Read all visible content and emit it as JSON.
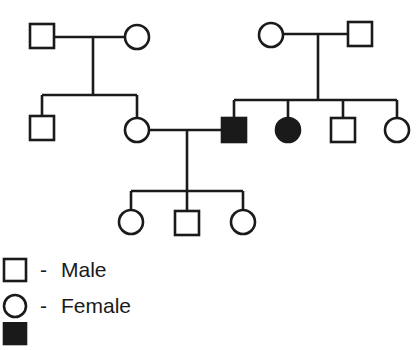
{
  "diagram": {
    "type": "pedigree",
    "line_color": "#1a1a1a",
    "fill_affected": "#1a1a1a",
    "individuals": [
      {
        "id": "I-1",
        "sex": "male",
        "affected": false,
        "generation": 1
      },
      {
        "id": "I-2",
        "sex": "female",
        "affected": false,
        "generation": 1
      },
      {
        "id": "I-3",
        "sex": "female",
        "affected": false,
        "generation": 1
      },
      {
        "id": "I-4",
        "sex": "male",
        "affected": false,
        "generation": 1
      },
      {
        "id": "II-1",
        "sex": "male",
        "affected": false,
        "generation": 2
      },
      {
        "id": "II-2",
        "sex": "female",
        "affected": false,
        "generation": 2
      },
      {
        "id": "II-3",
        "sex": "male",
        "affected": true,
        "generation": 2
      },
      {
        "id": "II-4",
        "sex": "female",
        "affected": true,
        "generation": 2
      },
      {
        "id": "II-5",
        "sex": "male",
        "affected": false,
        "generation": 2
      },
      {
        "id": "II-6",
        "sex": "female",
        "affected": false,
        "generation": 2
      },
      {
        "id": "III-1",
        "sex": "female",
        "affected": false,
        "generation": 3
      },
      {
        "id": "III-2",
        "sex": "male",
        "affected": false,
        "generation": 3
      },
      {
        "id": "III-3",
        "sex": "female",
        "affected": false,
        "generation": 3
      }
    ]
  },
  "legend": {
    "items": [
      {
        "symbol": "square",
        "dash": "-",
        "label": "Male"
      },
      {
        "symbol": "circle",
        "dash": "-",
        "label": "Female"
      },
      {
        "symbol": "filled-square",
        "dash": "-",
        "label": ""
      }
    ]
  }
}
